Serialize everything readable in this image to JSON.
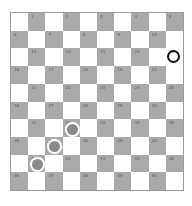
{
  "board": {
    "size": 10,
    "numbering": "1-50 on dark squares",
    "colors": {
      "light": "#ffffff",
      "dark": "#a9a9a9",
      "white_piece_fill": "#8a8a8a",
      "black_piece_ring": "#111111"
    },
    "highlighted_squares": [
      15
    ],
    "pieces": [
      {
        "square": 15,
        "color": "black"
      },
      {
        "square": 32,
        "color": "white"
      },
      {
        "square": 37,
        "color": "white"
      },
      {
        "square": 41,
        "color": "white"
      }
    ]
  }
}
